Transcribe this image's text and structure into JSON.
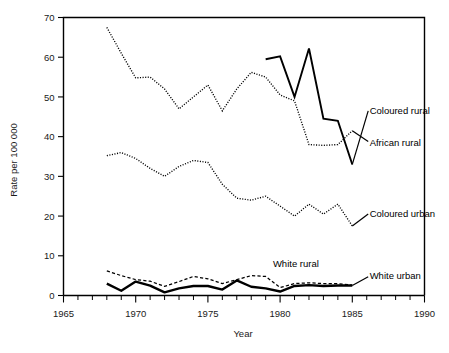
{
  "chart_data": {
    "type": "line",
    "title": "",
    "xlabel": "Year",
    "ylabel": "Rate per 100 000",
    "xlim": [
      1965,
      1990
    ],
    "ylim": [
      0,
      70
    ],
    "xticks": [
      1965,
      1970,
      1975,
      1980,
      1985,
      1990
    ],
    "xtick_labels": [
      "1965",
      "1970",
      "1975",
      "1980",
      "1985",
      "1990"
    ],
    "yticks": [
      0,
      10,
      20,
      30,
      40,
      50,
      60,
      70
    ],
    "ytick_labels": [
      "0",
      "10",
      "20",
      "30",
      "40",
      "50",
      "60",
      "70"
    ],
    "x_minor_tick_interval": 1,
    "grid": false,
    "legend": "inline-right-labels",
    "series": [
      {
        "name": "African rural",
        "style": "dotted",
        "label_anchor_year": 1986.2,
        "label_anchor_value": 38.5,
        "x": [
          1968,
          1969,
          1970,
          1971,
          1972,
          1973,
          1974,
          1975,
          1976,
          1977,
          1978,
          1979,
          1980,
          1981,
          1982,
          1983,
          1984,
          1985
        ],
        "values": [
          67.5,
          61.0,
          54.8,
          55.0,
          52.0,
          47.0,
          50.0,
          53.0,
          46.5,
          52.0,
          56.2,
          55.0,
          50.5,
          49.0,
          38.0,
          37.8,
          38.0,
          41.5
        ]
      },
      {
        "name": "Coloured rural",
        "style": "solid",
        "label_anchor_year": 1986.2,
        "label_anchor_value": 46.5,
        "x": [
          1979,
          1980,
          1981,
          1982,
          1983,
          1984,
          1985
        ],
        "values": [
          59.5,
          60.2,
          50.0,
          62.2,
          44.5,
          44.0,
          33.0
        ]
      },
      {
        "name": "Coloured urban",
        "style": "dotted",
        "label_anchor_year": 1986.2,
        "label_anchor_value": 20.5,
        "x": [
          1968,
          1969,
          1970,
          1971,
          1972,
          1973,
          1974,
          1975,
          1976,
          1977,
          1978,
          1979,
          1980,
          1981,
          1982,
          1983,
          1984,
          1985
        ],
        "values": [
          35.2,
          36.0,
          34.5,
          32.0,
          30.0,
          32.5,
          34.0,
          33.5,
          28.0,
          24.5,
          24.0,
          25.0,
          22.5,
          20.0,
          23.0,
          20.5,
          23.0,
          17.5
        ]
      },
      {
        "name": "White rural",
        "style": "dashed",
        "label_anchor_year": 1979.5,
        "label_anchor_value": 8.0,
        "x": [
          1968,
          1969,
          1970,
          1971,
          1972,
          1973,
          1974,
          1975,
          1976,
          1977,
          1978,
          1979,
          1980,
          1981,
          1982,
          1983,
          1984,
          1985
        ],
        "values": [
          6.2,
          5.0,
          4.0,
          3.6,
          2.3,
          3.5,
          4.8,
          4.2,
          3.0,
          4.0,
          5.0,
          4.8,
          2.0,
          3.0,
          3.2,
          3.0,
          3.0,
          2.6
        ]
      },
      {
        "name": "White urban",
        "style": "solid-thick",
        "label_anchor_year": 1986.2,
        "label_anchor_value": 5.0,
        "x": [
          1968,
          1969,
          1970,
          1971,
          1972,
          1973,
          1974,
          1975,
          1976,
          1977,
          1978,
          1979,
          1980,
          1981,
          1982,
          1983,
          1984,
          1985
        ],
        "values": [
          3.0,
          1.2,
          3.5,
          2.5,
          0.8,
          1.8,
          2.4,
          2.4,
          1.5,
          3.8,
          2.2,
          1.8,
          1.0,
          2.4,
          2.6,
          2.4,
          2.5,
          2.5
        ]
      }
    ]
  }
}
